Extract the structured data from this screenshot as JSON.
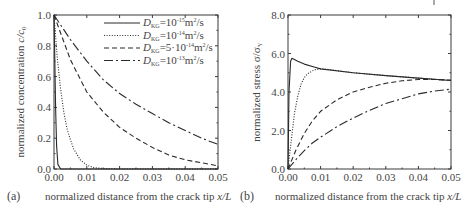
{
  "chart_data": [
    {
      "panel": "(a)",
      "type": "line",
      "title": "",
      "xlabel": "normalized distance from the crack tip x/L",
      "ylabel": "normalized concentration c/c0",
      "xlim": [
        0,
        0.05
      ],
      "ylim": [
        0,
        1.0
      ],
      "xticks": [
        "0.00",
        "0.01",
        "0.02",
        "0.03",
        "0.04",
        "0.05"
      ],
      "yticks": [
        "0.0",
        "0.2",
        "0.4",
        "0.6",
        "0.8",
        "1.0"
      ],
      "grid": false,
      "legend_position": "upper right",
      "series": [
        {
          "name": "D_KG=10^-15 m^2/s",
          "style": "solid",
          "x": [
            0,
            0.0002,
            0.0005,
            0.0008,
            0.0012,
            0.002,
            0.05
          ],
          "y": [
            1.0,
            0.75,
            0.4,
            0.15,
            0.03,
            0.0,
            0.0
          ]
        },
        {
          "name": "D_KG=10^-14 m^2/s",
          "style": "dotted",
          "x": [
            0,
            0.001,
            0.002,
            0.003,
            0.004,
            0.005,
            0.006,
            0.008,
            0.01,
            0.012,
            0.015,
            0.02,
            0.05
          ],
          "y": [
            1.0,
            0.72,
            0.52,
            0.37,
            0.26,
            0.19,
            0.13,
            0.06,
            0.025,
            0.01,
            0.003,
            0.0,
            0.0
          ]
        },
        {
          "name": "D_KG=5·10^-14 m^2/s",
          "style": "dashed",
          "x": [
            0,
            0.005,
            0.01,
            0.015,
            0.02,
            0.025,
            0.03,
            0.035,
            0.04,
            0.045,
            0.05
          ],
          "y": [
            1.0,
            0.71,
            0.5,
            0.37,
            0.27,
            0.2,
            0.14,
            0.09,
            0.06,
            0.04,
            0.02
          ]
        },
        {
          "name": "D_KG=10^-13 m^2/s",
          "style": "dashdot",
          "x": [
            0,
            0.005,
            0.01,
            0.015,
            0.02,
            0.025,
            0.03,
            0.035,
            0.04,
            0.045,
            0.05
          ],
          "y": [
            1.0,
            0.84,
            0.7,
            0.58,
            0.49,
            0.42,
            0.36,
            0.3,
            0.25,
            0.2,
            0.16
          ]
        }
      ]
    },
    {
      "panel": "(b)",
      "type": "line",
      "title": "",
      "xlabel": "normalized distance from the crack tip x/L",
      "ylabel": "normalized stress σ/σY",
      "xlim": [
        0,
        0.05
      ],
      "ylim": [
        0,
        8.0
      ],
      "xticks": [
        "0.00",
        "0.01",
        "0.02",
        "0.03",
        "0.04",
        "0.05"
      ],
      "yticks": [
        "0.0",
        "2.0",
        "4.0",
        "6.0",
        "8.0"
      ],
      "grid": false,
      "series": [
        {
          "name": "D_KG=10^-15 m^2/s",
          "style": "solid",
          "x": [
            0,
            0.0003,
            0.0008,
            0.0012,
            0.003,
            0.005,
            0.008,
            0.01,
            0.02,
            0.03,
            0.04,
            0.05
          ],
          "y": [
            0,
            4.0,
            5.6,
            5.75,
            5.6,
            5.45,
            5.3,
            5.2,
            5.0,
            4.85,
            4.72,
            4.6
          ]
        },
        {
          "name": "D_KG=10^-14 m^2/s",
          "style": "dotted",
          "x": [
            0,
            0.001,
            0.002,
            0.003,
            0.004,
            0.005,
            0.006,
            0.008,
            0.01,
            0.012,
            0.02,
            0.03,
            0.04,
            0.05
          ],
          "y": [
            0,
            1.5,
            2.9,
            3.8,
            4.4,
            4.75,
            4.95,
            5.15,
            5.2,
            5.18,
            5.0,
            4.85,
            4.72,
            4.6
          ]
        },
        {
          "name": "D_KG=5·10^-14 m^2/s",
          "style": "dashed",
          "x": [
            0,
            0.0025,
            0.005,
            0.0075,
            0.01,
            0.015,
            0.02,
            0.025,
            0.03,
            0.035,
            0.04,
            0.045,
            0.05
          ],
          "y": [
            0,
            1.0,
            1.85,
            2.5,
            3.0,
            3.6,
            4.0,
            4.25,
            4.45,
            4.58,
            4.65,
            4.65,
            4.62
          ]
        },
        {
          "name": "D_KG=10^-13 m^2/s",
          "style": "dashdot",
          "x": [
            0,
            0.0025,
            0.005,
            0.0075,
            0.01,
            0.015,
            0.02,
            0.025,
            0.03,
            0.035,
            0.04,
            0.045,
            0.05
          ],
          "y": [
            0,
            0.5,
            0.95,
            1.35,
            1.65,
            2.2,
            2.65,
            3.05,
            3.4,
            3.65,
            3.9,
            4.05,
            4.15
          ]
        }
      ]
    }
  ],
  "panels": {
    "a": {
      "label": "(a)",
      "xlabel": "normalized distance from the crack tip ",
      "xlabel_var": "x/L",
      "ylabel": "normalized concentration ",
      "ylabel_var": "c/c",
      "ylabel_sub": "0",
      "xticks": [
        "0.00",
        "0.01",
        "0.02",
        "0.03",
        "0.04",
        "0.05"
      ],
      "yticks": [
        "0.0",
        "0.2",
        "0.4",
        "0.6",
        "0.8",
        "1.0"
      ],
      "legend": [
        {
          "D": "D",
          "sub": "KG",
          "eq": "=10",
          "exp": "-15",
          "unit": "m",
          "unit_exp": "2",
          "tail": "/s"
        },
        {
          "D": "D",
          "sub": "KG",
          "eq": "=10",
          "exp": "-14",
          "unit": "m",
          "unit_exp": "2",
          "tail": "/s"
        },
        {
          "D": "D",
          "sub": "KG",
          "eq": "=5·10",
          "exp": "-14",
          "unit": "m",
          "unit_exp": "2",
          "tail": "/s"
        },
        {
          "D": "D",
          "sub": "KG",
          "eq": "=10",
          "exp": "-13",
          "unit": "m",
          "unit_exp": "2",
          "tail": "/s"
        }
      ]
    },
    "b": {
      "label": "(b)",
      "xlabel": "normalized distance from the crack tip ",
      "xlabel_var": "x/L",
      "ylabel": "normalized stress  σ/σ",
      "ylabel_sub": "Y",
      "xticks": [
        "0.00",
        "0.01",
        "0.02",
        "0.03",
        "0.04",
        "0.05"
      ],
      "yticks": [
        "0.0",
        "2.0",
        "4.0",
        "6.0",
        "8.0"
      ]
    }
  },
  "colors": {
    "line": "#2a2a2a",
    "axis": "#3a3a3a",
    "text": "#444444"
  }
}
